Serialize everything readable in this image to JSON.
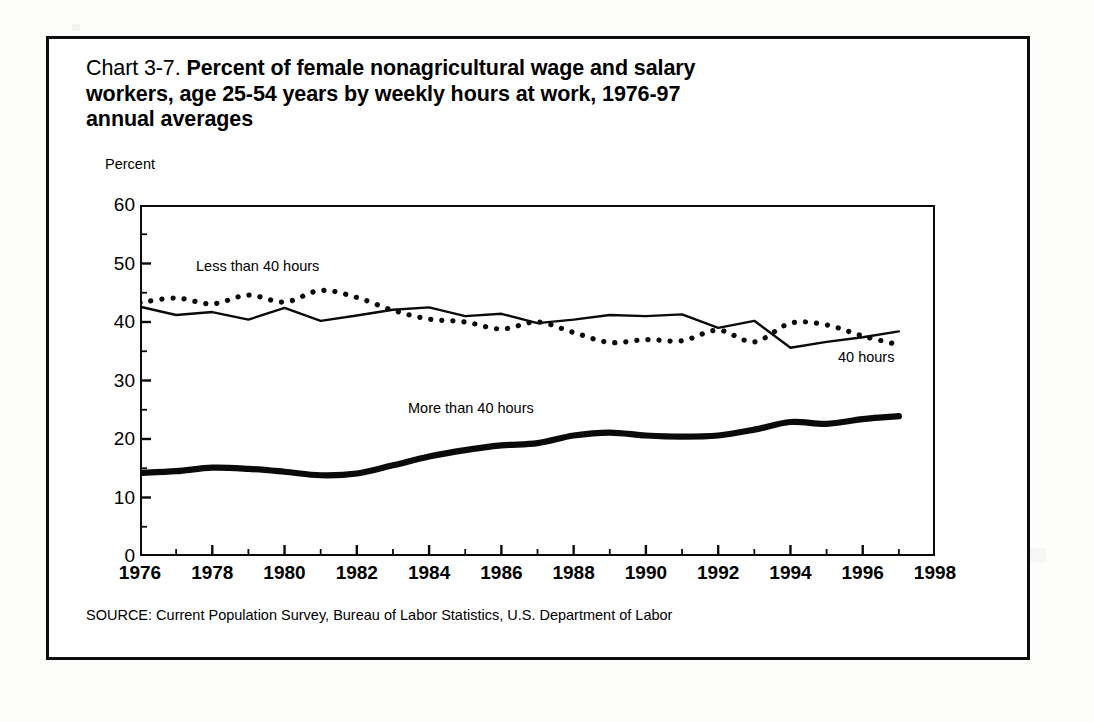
{
  "title": {
    "chart_number": "Chart 3-7.",
    "text": " Percent of female nonagricultural wage and salary workers, age 25-54 years by weekly hours at work, 1976-97 annual averages",
    "full": "Chart 3-7. Percent of female nonagricultural wage and salary workers, age 25-54 years by weekly hours at work, 1976-97 annual averages"
  },
  "source": "SOURCE: Current Population Survey, Bureau of Labor Statistics, U.S. Department of Labor",
  "axis": {
    "y_title": "Percent",
    "y_ticks": [
      "0",
      "10",
      "20",
      "30",
      "40",
      "50",
      "60"
    ],
    "x_ticks": [
      "1976",
      "1978",
      "1980",
      "1982",
      "1984",
      "1986",
      "1988",
      "1990",
      "1992",
      "1994",
      "1996",
      "1998"
    ]
  },
  "annotations": {
    "less_than_40": "Less than 40 hours",
    "exactly_40": "40 hours",
    "more_than_40": "More than 40 hours"
  },
  "colors": {
    "ink": "#0a0a0a",
    "paper": "#ffffff",
    "page": "#fdfdfc"
  },
  "chart_data": {
    "type": "line",
    "title": "Chart 3-7. Percent of female nonagricultural wage and salary workers, age 25-54 years by weekly hours at work, 1976-97 annual averages",
    "xlabel": "",
    "ylabel": "Percent",
    "xlim": [
      1976,
      1998
    ],
    "ylim": [
      0,
      60
    ],
    "ytick_step": 10,
    "xtick_step": 2,
    "minor_xtick_step": 1,
    "grid": false,
    "legend": "inline-annotations",
    "x": [
      1976,
      1977,
      1978,
      1979,
      1980,
      1981,
      1982,
      1983,
      1984,
      1985,
      1986,
      1987,
      1988,
      1989,
      1990,
      1991,
      1992,
      1993,
      1994,
      1995,
      1996,
      1997
    ],
    "series": [
      {
        "name": "Less than 40 hours",
        "style": "dotted",
        "values": [
          43.3,
          44.1,
          43.1,
          44.6,
          43.4,
          45.4,
          44.2,
          42.0,
          40.5,
          40.0,
          38.8,
          40.0,
          38.2,
          36.5,
          37.0,
          36.8,
          38.6,
          36.6,
          39.8,
          39.5,
          37.6,
          36.1
        ]
      },
      {
        "name": "40 hours",
        "style": "solid-thin",
        "values": [
          42.6,
          41.2,
          41.7,
          40.4,
          42.4,
          40.2,
          41.1,
          42.1,
          42.5,
          41.0,
          41.4,
          39.8,
          40.4,
          41.2,
          41.0,
          41.3,
          39.0,
          40.2,
          35.6,
          36.6,
          37.4,
          38.4
        ]
      },
      {
        "name": "More than 40 hours",
        "style": "solid-thick",
        "values": [
          14.2,
          14.5,
          15.1,
          14.9,
          14.4,
          13.8,
          14.1,
          15.5,
          17.0,
          18.1,
          18.9,
          19.3,
          20.6,
          21.1,
          20.6,
          20.4,
          20.6,
          21.6,
          22.9,
          22.6,
          23.4,
          23.9
        ]
      }
    ]
  }
}
